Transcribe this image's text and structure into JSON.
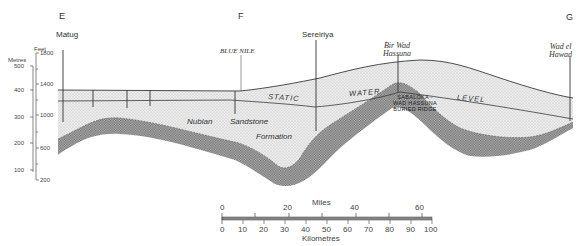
{
  "section_markers": [
    {
      "id": "E",
      "label": "E"
    },
    {
      "id": "F",
      "label": "F"
    },
    {
      "id": "G",
      "label": "G"
    }
  ],
  "places": {
    "matug": "Matug",
    "blue_nile": "BLUE NILE",
    "sereiriya": "Sereiriya",
    "bir_wad_hassuna": [
      "Bir Wad",
      "Hassuna"
    ],
    "wad_el_hawad": [
      "Wad el",
      "Hawad"
    ]
  },
  "axes": {
    "metres": {
      "title": "Metres",
      "ticks": [
        "500",
        "400",
        "300",
        "200",
        "100"
      ]
    },
    "feet": {
      "title": "Feet",
      "ticks": [
        "1800",
        "1400",
        "1000",
        "600",
        "200"
      ]
    }
  },
  "formation": {
    "words": [
      "Nubian",
      "Sandstone",
      "Formation"
    ]
  },
  "water_level": {
    "words": [
      "STATIC",
      "WATER",
      "LEVEL"
    ]
  },
  "ridge": {
    "lines": [
      "SABALOKA -",
      "WAD HASSUNA",
      "BURIED  RIDGE"
    ]
  },
  "scale_bar": {
    "miles_title": "Miles",
    "miles_ticks": [
      "0",
      "20",
      "40",
      "60"
    ],
    "km_ticks": [
      "0",
      "10",
      "20",
      "30",
      "40",
      "50",
      "60",
      "70",
      "80",
      "90",
      "100"
    ],
    "km_title": "Kilometres"
  },
  "colors": {
    "line": "#3a3a3a",
    "sandstone_fill": "#e4e4e4",
    "basement_fill": "#9a9a9a"
  }
}
